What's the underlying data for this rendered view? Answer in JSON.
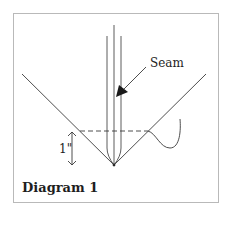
{
  "figure": {
    "title": "Diagram 1",
    "labels": {
      "seam": "Seam",
      "measurement": "1\""
    },
    "elements": [
      "v-shaped fabric edges",
      "three vertical seam lines converging at point",
      "arrow pointing to seam",
      "dashed horizontal line 1 inch above point",
      "double-headed measurement arrow",
      "thread curve"
    ],
    "colors": {
      "line": "#3a3a3a",
      "border": "#b9b9b9",
      "text": "#1e1e1e"
    }
  }
}
